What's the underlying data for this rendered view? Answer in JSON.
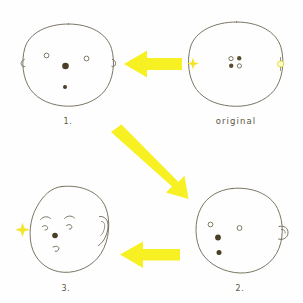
{
  "diagram": {
    "style": "hand-drawn pencil sketch on white paper",
    "ink_color": "#6b6550",
    "accent_color": "#f7f023",
    "background": "#ffffff",
    "width": 303,
    "height": 303
  },
  "panels": [
    {
      "id": "original",
      "label": "original",
      "position": "top-right",
      "description": "plain circle head outline with a 2x2 cluster of small marks in the center",
      "cx": 236,
      "cy": 65,
      "features": {
        "head": "circle outline",
        "cluster": "2x2 grid: two open circles and two filled dots",
        "left_mark": "yellow sparkle",
        "right_mark": "yellow ring"
      }
    },
    {
      "id": "step1",
      "label": "1.",
      "position": "top-left",
      "description": "round head with two open circle eyes, a large filled nose dot and a small mouth dot, tiny ear notches on both sides",
      "cx": 68,
      "cy": 66,
      "features": {
        "head": "round head outline",
        "eyes": "two open circles",
        "nose": "large filled dot",
        "mouth": "small filled dot",
        "ears": "small notch on left and right"
      }
    },
    {
      "id": "step2",
      "label": "2.",
      "position": "bottom-right",
      "description": "tilted head with an ear bump on the right, two open circle eyes and two filled dots offset to the left",
      "cx": 236,
      "cy": 232,
      "features": {
        "head": "tilted head outline",
        "eyes": "two open circles",
        "nose": "filled dot",
        "mouth": "filled dot",
        "ear": "bump on right side"
      }
    },
    {
      "id": "step3",
      "label": "3.",
      "position": "bottom-left",
      "description": "detailed tilted head with eyebrows, two eyes, nose dot and curved mouth, a drawn ear on the right and a yellow sparkle at the left",
      "cx": 68,
      "cy": 232,
      "features": {
        "head": "tilted head outline",
        "eyebrows": "two curved arcs",
        "eyes": "two small curved eyes",
        "nose": "filled dot",
        "mouth": "small curved line",
        "ear": "drawn ear on right",
        "left_mark": "yellow sparkle"
      }
    }
  ],
  "arrows": [
    {
      "id": "arrow-original-to-1",
      "direction": "left",
      "from": "original",
      "to": "step1",
      "color": "#f7f023"
    },
    {
      "id": "arrow-1-to-2",
      "direction": "down-right",
      "from": "step1",
      "to": "step2",
      "color": "#f7f023"
    },
    {
      "id": "arrow-2-to-3",
      "direction": "left",
      "from": "step2",
      "to": "step3",
      "color": "#f7f023"
    }
  ]
}
